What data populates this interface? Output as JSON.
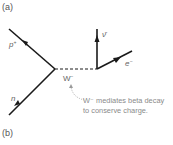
{
  "panels": {
    "a_label": "(a)",
    "b_label": "(b)"
  },
  "diagram": {
    "type": "feynman-diagram",
    "particles": {
      "proton": {
        "label": "p",
        "charge": "+"
      },
      "neutron": {
        "label": "n"
      },
      "boson": {
        "label": "W",
        "charge": "−"
      },
      "antineutrino": {
        "label": "ν̄"
      },
      "electron": {
        "label": "e",
        "charge": "−"
      }
    },
    "annotation": {
      "line1": "W⁻ mediates beta decay",
      "line2": "to conserve charge."
    },
    "colors": {
      "line": "#1a1a1a",
      "label": "#666666",
      "annotation": "#8a8a8a",
      "leader": "#9a9a9a"
    }
  }
}
